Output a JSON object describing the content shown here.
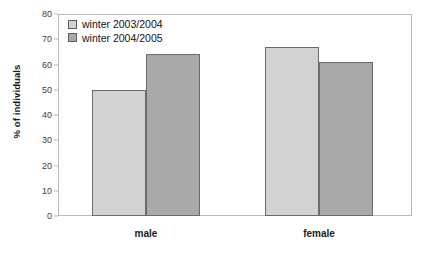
{
  "chart_data": {
    "type": "bar",
    "title": "",
    "xlabel": "",
    "ylabel": "% of individuals",
    "ylim": [
      0,
      80
    ],
    "yticks": [
      0,
      10,
      20,
      30,
      40,
      50,
      60,
      70,
      80
    ],
    "ytick_labels": [
      "0",
      "10",
      "20",
      "30",
      "40",
      "50",
      "60",
      "70",
      "80"
    ],
    "grid": false,
    "legend_position": "top-left",
    "categories": [
      "male",
      "female"
    ],
    "series": [
      {
        "name": "winter 2003/2004",
        "color": "#d2d2d2",
        "values": [
          50,
          67
        ]
      },
      {
        "name": "winter 2004/2005",
        "color": "#a9a9a9",
        "values": [
          64,
          61
        ]
      }
    ]
  },
  "colors": {
    "series_light": "#d2d2d2",
    "series_dark": "#a9a9a9",
    "bar_outline": "#6b6b6b",
    "frame": "#b9b9b9",
    "text": "#1a1a1a",
    "background": "#ffffff"
  }
}
